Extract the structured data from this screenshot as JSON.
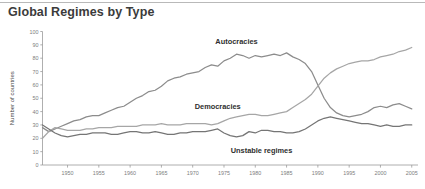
{
  "header": {
    "title": "Global Regimes by Type"
  },
  "colors": {
    "axis": "#9a9a9a",
    "tick_text": "#7d7d7d",
    "title_text": "#3b3b3b",
    "label_text": "#2f2f2f",
    "autocracies": "#8c8c8c",
    "democracies": "#a6a6a6",
    "unstable": "#757575",
    "top_rule": "#b9b9b9",
    "background": "#ffffff"
  },
  "chart_data": {
    "type": "line",
    "title": "Global Regimes by Type",
    "xlabel": "",
    "ylabel": "Number of countries",
    "xlim": [
      1946,
      2006
    ],
    "ylim": [
      0,
      100
    ],
    "grid": false,
    "legend": "inline-annotations",
    "xticks": [
      1950,
      1955,
      1960,
      1965,
      1970,
      1975,
      1980,
      1985,
      1990,
      1995,
      2000,
      2005
    ],
    "yticks": [
      0,
      10,
      20,
      30,
      40,
      50,
      60,
      70,
      80,
      90,
      100
    ],
    "x": [
      1946,
      1947,
      1948,
      1949,
      1950,
      1951,
      1952,
      1953,
      1954,
      1955,
      1956,
      1957,
      1958,
      1959,
      1960,
      1961,
      1962,
      1963,
      1964,
      1965,
      1966,
      1967,
      1968,
      1969,
      1970,
      1971,
      1972,
      1973,
      1974,
      1975,
      1976,
      1977,
      1978,
      1979,
      1980,
      1981,
      1982,
      1983,
      1984,
      1985,
      1986,
      1987,
      1988,
      1989,
      1990,
      1991,
      1992,
      1993,
      1994,
      1995,
      1996,
      1997,
      1998,
      1999,
      2000,
      2001,
      2002,
      2003,
      2004,
      2005
    ],
    "series": [
      {
        "name": "Autocracies",
        "color": "#8c8c8c",
        "label_x": 1977,
        "label_y": 91,
        "values": [
          28,
          25,
          27,
          29,
          31,
          33,
          34,
          36,
          37,
          37,
          39,
          41,
          43,
          44,
          47,
          50,
          52,
          55,
          56,
          59,
          63,
          65,
          66,
          68,
          69,
          70,
          73,
          75,
          74,
          78,
          80,
          83,
          82,
          80,
          82,
          81,
          82,
          83,
          82,
          84,
          81,
          79,
          76,
          70,
          60,
          50,
          43,
          39,
          37,
          36,
          37,
          38,
          40,
          43,
          44,
          43,
          45,
          46,
          44,
          42
        ]
      },
      {
        "name": "Democracies",
        "color": "#a6a6a6",
        "label_x": 1974,
        "label_y": 42,
        "values": [
          20,
          25,
          28,
          27,
          26,
          26,
          26,
          27,
          27,
          28,
          28,
          28,
          29,
          29,
          29,
          29,
          30,
          30,
          30,
          31,
          30,
          30,
          30,
          31,
          31,
          31,
          31,
          30,
          31,
          33,
          35,
          36,
          37,
          38,
          38,
          37,
          37,
          38,
          39,
          40,
          43,
          46,
          49,
          53,
          59,
          65,
          69,
          72,
          74,
          76,
          77,
          78,
          78,
          79,
          81,
          82,
          83,
          85,
          86,
          88
        ]
      },
      {
        "name": "Unstable regimes",
        "color": "#757575",
        "label_x": 1981,
        "label_y": 9,
        "values": [
          30,
          27,
          24,
          22,
          21,
          22,
          23,
          23,
          24,
          24,
          24,
          23,
          23,
          24,
          25,
          25,
          24,
          24,
          25,
          24,
          23,
          23,
          24,
          24,
          25,
          25,
          25,
          26,
          27,
          24,
          22,
          21,
          22,
          25,
          24,
          26,
          26,
          25,
          25,
          24,
          24,
          25,
          27,
          30,
          33,
          35,
          36,
          35,
          34,
          33,
          32,
          31,
          31,
          30,
          29,
          30,
          29,
          29,
          30,
          30
        ]
      }
    ]
  }
}
